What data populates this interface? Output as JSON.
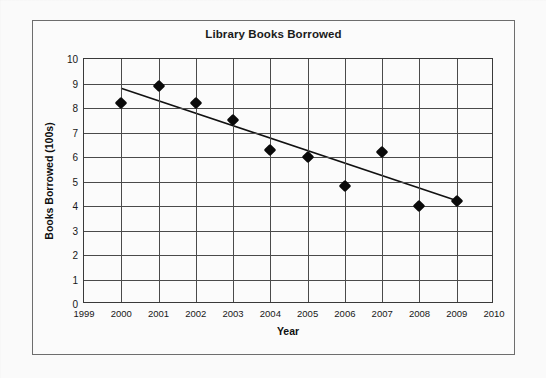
{
  "chart_data": {
    "type": "scatter",
    "title": "Library Books Borrowed",
    "xlabel": "Year",
    "ylabel": "Books Borrowed  (100s)",
    "xlim": [
      1999,
      2010
    ],
    "ylim": [
      0,
      10
    ],
    "grid": true,
    "legend": null,
    "x_ticks": [
      "1999",
      "2000",
      "2001",
      "2002",
      "2003",
      "2004",
      "2005",
      "2006",
      "2007",
      "2008",
      "2009",
      "2010"
    ],
    "y_ticks": [
      "0",
      "1",
      "2",
      "3",
      "4",
      "5",
      "6",
      "7",
      "8",
      "9",
      "10"
    ],
    "x": [
      2000,
      2001,
      2002,
      2003,
      2004,
      2005,
      2006,
      2007,
      2008,
      2009
    ],
    "values": [
      8.2,
      8.9,
      8.2,
      7.5,
      6.3,
      6.0,
      4.8,
      6.2,
      4.0,
      4.2
    ],
    "series": [
      {
        "name": "Books Borrowed",
        "marker": "diamond",
        "color": "#0a0a0a",
        "points": [
          {
            "x": 2000,
            "y": 8.2
          },
          {
            "x": 2001,
            "y": 8.9
          },
          {
            "x": 2002,
            "y": 8.2
          },
          {
            "x": 2003,
            "y": 7.5
          },
          {
            "x": 2004,
            "y": 6.3
          },
          {
            "x": 2005,
            "y": 6.0
          },
          {
            "x": 2006,
            "y": 4.8
          },
          {
            "x": 2007,
            "y": 6.2
          },
          {
            "x": 2008,
            "y": 4.0
          },
          {
            "x": 2009,
            "y": 4.2
          }
        ]
      }
    ],
    "trendline": {
      "name": "line of best fit",
      "color": "#111111",
      "start": {
        "x": 2000,
        "y": 8.8
      },
      "end": {
        "x": 2009,
        "y": 4.2
      }
    }
  }
}
